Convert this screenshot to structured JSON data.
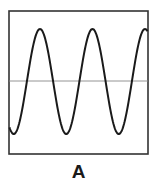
{
  "figure": {
    "label": "A",
    "frame_color": "#333333",
    "wave_color": "#1a1a1a",
    "axis_color": "#777777"
  },
  "waveform": {
    "type": "sinusoid",
    "cycles_visible": 2.6,
    "description": "Sine wave oscillating about a horizontal midline inside a rectangular frame"
  }
}
